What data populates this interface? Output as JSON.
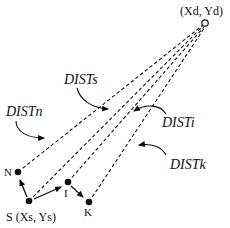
{
  "destination": {
    "label": "(Xd, Yd)",
    "x": 205,
    "y": 23
  },
  "nodes": [
    {
      "id": "S",
      "label": "S (Xs, Ys)",
      "x": 29,
      "y": 201
    },
    {
      "id": "N",
      "label": "N",
      "x": 18,
      "y": 172
    },
    {
      "id": "I",
      "label": "I",
      "x": 68,
      "y": 182
    },
    {
      "id": "K",
      "label": "K",
      "x": 89,
      "y": 202
    }
  ],
  "distances": [
    {
      "id": "DISTn",
      "label": "DISTn",
      "from": "N"
    },
    {
      "id": "DISTs",
      "label": "DISTs",
      "from": "S"
    },
    {
      "id": "DISTi",
      "label": "DISTi",
      "from": "I"
    },
    {
      "id": "DISTk",
      "label": "DISTk",
      "from": "K"
    }
  ],
  "colors": {
    "ink": "#111111",
    "background": "#ffffff"
  }
}
